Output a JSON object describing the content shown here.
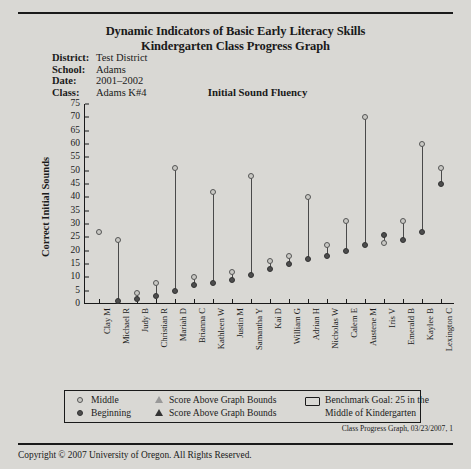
{
  "header": {
    "title_line1": "Dynamic Indicators of Basic Early Literacy Skills",
    "title_line2": "Kindergarten Class Progress Graph",
    "measure_title": "Initial Sound Fluency",
    "fields": [
      {
        "label": "District:",
        "value": "Test District"
      },
      {
        "label": "School:",
        "value": "Adams"
      },
      {
        "label": "Date:",
        "value": "2001–2002"
      },
      {
        "label": "Class:",
        "value": "Adams K#4"
      }
    ]
  },
  "legend": {
    "middle_label": "Middle",
    "beginning_label": "Beginning",
    "above_bounds_open": "Score Above Graph Bounds",
    "above_bounds_solid": "Score Above Graph Bounds",
    "benchmark_line1": "Benchmark Goal: 25 in the",
    "benchmark_line2": "Middle of Kindergarten"
  },
  "footer": {
    "reference": "Class Progress Graph, 03/23/2007, 1",
    "copyright": "Copyright © 2007 University of Oregon. All Rights Reserved."
  },
  "chart_data": {
    "type": "scatter",
    "title": "Initial Sound Fluency",
    "xlabel": "",
    "ylabel": "Correct Initial Sounds",
    "ylim": [
      0,
      75
    ],
    "ytick_step": 5,
    "yticks": [
      0,
      5,
      10,
      15,
      20,
      25,
      30,
      35,
      40,
      45,
      50,
      55,
      60,
      65,
      70,
      75
    ],
    "grid": false,
    "legend_position": "bottom",
    "categories": [
      "Clay M",
      "Michael R",
      "Judy B",
      "Christian R",
      "Mariah D",
      "Brianna C",
      "Kathleen W",
      "Justin M",
      "Samantha Y",
      "Kai D",
      "William G",
      "Adrian H",
      "Nicholas W",
      "Calem E",
      "Austene M",
      "Iris V",
      "Emerald B",
      "Kaylee B",
      "Lexington C"
    ],
    "series": [
      {
        "name": "Beginning",
        "marker": "filled-circle",
        "color": "#4d4d4d",
        "values": [
          null,
          1,
          2,
          3,
          5,
          7,
          8,
          9,
          11,
          13,
          15,
          17,
          18,
          20,
          22,
          26,
          24,
          27,
          45
        ]
      },
      {
        "name": "Middle",
        "marker": "open-circle",
        "color": "#c9c8c4",
        "values": [
          27,
          24,
          4,
          8,
          51,
          10,
          42,
          12,
          48,
          16,
          18,
          40,
          22,
          31,
          70,
          23,
          31,
          60,
          51
        ]
      }
    ]
  }
}
